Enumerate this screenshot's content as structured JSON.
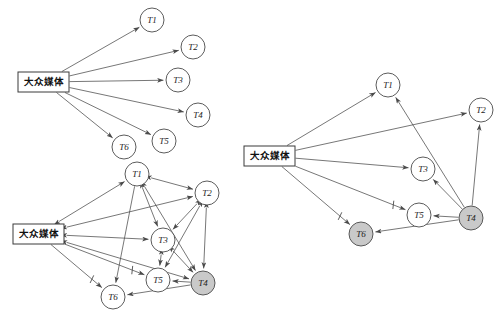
{
  "figure": {
    "background_color": "#ffffff",
    "stroke_color": "#4a4a4a",
    "shaded_node_color": "#c9c9c9",
    "node_radius": 12,
    "media_label": "大众媒体"
  },
  "panels": [
    {
      "id": "panel-initial",
      "name": "initial-state-graph",
      "media_box": {
        "x": 18,
        "y": 72,
        "w": 51,
        "h": 20,
        "label": "大众媒体"
      },
      "nodes": [
        {
          "id": "T1",
          "label": "T1",
          "x": 152,
          "y": 20,
          "shaded": false
        },
        {
          "id": "T2",
          "label": "T2",
          "x": 193,
          "y": 47,
          "shaded": false
        },
        {
          "id": "T3",
          "label": "T3",
          "x": 178,
          "y": 80,
          "shaded": false
        },
        {
          "id": "T4",
          "label": "T4",
          "x": 198,
          "y": 115,
          "shaded": false
        },
        {
          "id": "T5",
          "label": "T5",
          "x": 164,
          "y": 141,
          "shaded": false
        },
        {
          "id": "T6",
          "label": "T6",
          "x": 124,
          "y": 147,
          "shaded": false
        }
      ],
      "edges": [
        {
          "from": "MEDIA",
          "to": "T1",
          "arrow": "forward",
          "slash": false
        },
        {
          "from": "MEDIA",
          "to": "T2",
          "arrow": "forward",
          "slash": false
        },
        {
          "from": "MEDIA",
          "to": "T3",
          "arrow": "forward",
          "slash": false
        },
        {
          "from": "MEDIA",
          "to": "T4",
          "arrow": "forward",
          "slash": false
        },
        {
          "from": "MEDIA",
          "to": "T5",
          "arrow": "forward",
          "slash": false
        },
        {
          "from": "MEDIA",
          "to": "T6",
          "arrow": "forward",
          "slash": false
        }
      ]
    },
    {
      "id": "panel-dense",
      "name": "dense-interaction-graph",
      "media_box": {
        "x": 13,
        "y": 224,
        "w": 51,
        "h": 20,
        "label": "大众媒体"
      },
      "nodes": [
        {
          "id": "T1",
          "label": "T1",
          "x": 137,
          "y": 174,
          "shaded": false
        },
        {
          "id": "T2",
          "label": "T2",
          "x": 207,
          "y": 193,
          "shaded": false
        },
        {
          "id": "T3",
          "label": "T3",
          "x": 163,
          "y": 240,
          "shaded": false
        },
        {
          "id": "T5",
          "label": "T5",
          "x": 158,
          "y": 280,
          "shaded": false
        },
        {
          "id": "T4",
          "label": "T4",
          "x": 203,
          "y": 283,
          "shaded": true
        },
        {
          "id": "T6",
          "label": "T6",
          "x": 113,
          "y": 297,
          "shaded": false
        }
      ],
      "edges": [
        {
          "from": "MEDIA",
          "to": "T1",
          "arrow": "both",
          "slash": false
        },
        {
          "from": "MEDIA",
          "to": "T2",
          "arrow": "both",
          "slash": false
        },
        {
          "from": "MEDIA",
          "to": "T3",
          "arrow": "both",
          "slash": false
        },
        {
          "from": "MEDIA",
          "to": "T4",
          "arrow": "both",
          "slash": false
        },
        {
          "from": "MEDIA",
          "to": "T5",
          "arrow": "forward",
          "slash": true
        },
        {
          "from": "MEDIA",
          "to": "T6",
          "arrow": "forward",
          "slash": true
        },
        {
          "from": "T1",
          "to": "T2",
          "arrow": "both",
          "slash": false
        },
        {
          "from": "T1",
          "to": "T3",
          "arrow": "both",
          "slash": false
        },
        {
          "from": "T1",
          "to": "T4",
          "arrow": "both",
          "slash": false
        },
        {
          "from": "T1",
          "to": "T6",
          "arrow": "forward",
          "slash": false
        },
        {
          "from": "T2",
          "to": "T3",
          "arrow": "both",
          "slash": false
        },
        {
          "from": "T2",
          "to": "T4",
          "arrow": "both",
          "slash": false
        },
        {
          "from": "T2",
          "to": "T5",
          "arrow": "both",
          "slash": false
        },
        {
          "from": "T3",
          "to": "T4",
          "arrow": "both",
          "slash": false
        },
        {
          "from": "T3",
          "to": "T5",
          "arrow": "both",
          "slash": false
        },
        {
          "from": "T4",
          "to": "T5",
          "arrow": "forward",
          "slash": false
        },
        {
          "from": "T4",
          "to": "T6",
          "arrow": "forward",
          "slash": false
        }
      ]
    },
    {
      "id": "panel-final",
      "name": "final-state-graph",
      "media_box": {
        "x": 244,
        "y": 146,
        "w": 51,
        "h": 20,
        "label": "大众媒体"
      },
      "nodes": [
        {
          "id": "T1",
          "label": "T1",
          "x": 388,
          "y": 85,
          "shaded": false
        },
        {
          "id": "T2",
          "label": "T2",
          "x": 481,
          "y": 110,
          "shaded": false
        },
        {
          "id": "T3",
          "label": "T3",
          "x": 423,
          "y": 169,
          "shaded": false
        },
        {
          "id": "T5",
          "label": "T5",
          "x": 419,
          "y": 215,
          "shaded": false
        },
        {
          "id": "T4",
          "label": "T4",
          "x": 471,
          "y": 218,
          "shaded": true
        },
        {
          "id": "T6",
          "label": "T6",
          "x": 361,
          "y": 234,
          "shaded": true
        }
      ],
      "edges": [
        {
          "from": "MEDIA",
          "to": "T1",
          "arrow": "forward",
          "slash": false
        },
        {
          "from": "MEDIA",
          "to": "T2",
          "arrow": "forward",
          "slash": false
        },
        {
          "from": "MEDIA",
          "to": "T3",
          "arrow": "forward",
          "slash": false
        },
        {
          "from": "MEDIA",
          "to": "T5",
          "arrow": "forward",
          "slash": true
        },
        {
          "from": "MEDIA",
          "to": "T6",
          "arrow": "forward",
          "slash": true
        },
        {
          "from": "T4",
          "to": "T1",
          "arrow": "forward",
          "slash": false
        },
        {
          "from": "T4",
          "to": "T2",
          "arrow": "forward",
          "slash": false
        },
        {
          "from": "T4",
          "to": "T3",
          "arrow": "forward",
          "slash": false
        },
        {
          "from": "T4",
          "to": "T5",
          "arrow": "forward",
          "slash": false
        },
        {
          "from": "T4",
          "to": "T6",
          "arrow": "forward",
          "slash": false
        }
      ]
    }
  ]
}
